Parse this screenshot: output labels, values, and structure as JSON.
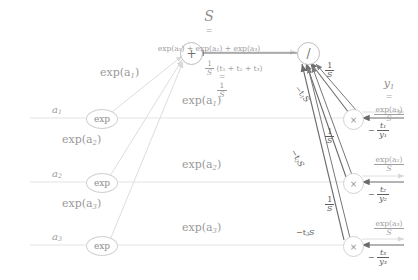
{
  "diagram": {
    "title_symbol": "S",
    "title_equals": "=",
    "title_expression": "exp(a₁) + exp(a₂) + exp(a₃)",
    "nodes": {
      "plus": "+",
      "divide": "/",
      "exp": "exp",
      "times": "×"
    },
    "inputs": [
      {
        "label": "a",
        "sub": "1"
      },
      {
        "label": "a",
        "sub": "2"
      },
      {
        "label": "a",
        "sub": "3"
      }
    ],
    "forward_edge_labels": [
      {
        "text": "exp(a",
        "sub": "1",
        "tail": ")"
      },
      {
        "text": "exp(a",
        "sub": "2",
        "tail": ")"
      },
      {
        "text": "exp(a",
        "sub": "3",
        "tail": ")"
      }
    ],
    "forward_edge_labels_upper": [
      {
        "text": "exp(a",
        "sub": "1",
        "tail": ")"
      },
      {
        "text": "exp(a",
        "sub": "2",
        "tail": ")"
      },
      {
        "text": "exp(a",
        "sub": "3",
        "tail": ")"
      }
    ],
    "sum_backward": {
      "expression_num": "1",
      "expression_den": "S",
      "expression_rest": "(t₁ + t₂ + t₃)",
      "equals": "=",
      "result_num": "1",
      "result_den": "S"
    },
    "grad_one_over_s": {
      "num": "1",
      "den": "S"
    },
    "grad_minus_tS": [
      {
        "text": "−t",
        "sub": "1",
        "tail": "S"
      },
      {
        "text": "−t",
        "sub": "2",
        "tail": "S"
      },
      {
        "text": "−t",
        "sub": "3",
        "tail": "S"
      }
    ],
    "outputs": [
      {
        "symbol": "y",
        "sub": "1",
        "equals": "=",
        "num": "exp(a₁)",
        "den": "S",
        "grad_num": "t₁",
        "grad_den": "y₁",
        "grad_sign": "−"
      },
      {
        "symbol": "y",
        "sub": "2",
        "equals": "=",
        "num": "exp(a₂)",
        "den": "S",
        "grad_num": "t₂",
        "grad_den": "y₂",
        "grad_sign": "−"
      },
      {
        "symbol": "y",
        "sub": "3",
        "equals": "=",
        "num": "exp(a₃)",
        "den": "S",
        "grad_num": "t₃",
        "grad_den": "y₃",
        "grad_sign": "−"
      }
    ],
    "colors": {
      "forward": "#d8d8d8",
      "backward": "#6b6b6b",
      "text": "#9a9a9a",
      "text_dark": "#5c5c5c",
      "background": "#ffffff"
    }
  }
}
